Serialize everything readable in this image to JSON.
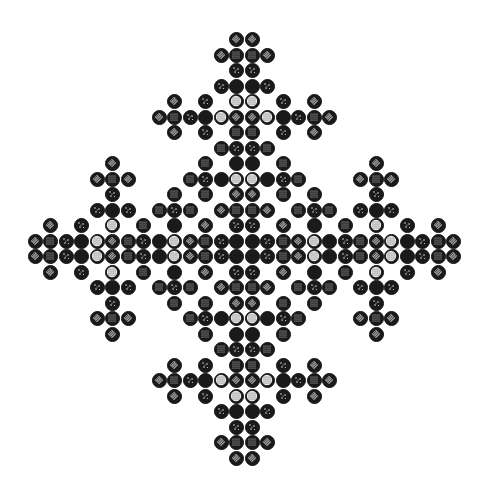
{
  "figure": {
    "title": "",
    "symmetry": "four-fold mirror (horizontal and vertical)",
    "grid_size": 28,
    "pitch_px": 15.5,
    "origin_px": [
      35,
      39.5
    ],
    "cell_types": {
      "D": "diamond-hatched",
      "G": "dense-dot-grid",
      "S": "sparse-dots",
      "B": "solid-black",
      "L": "light-dotted"
    },
    "colors": {
      "ink": "#111111",
      "fill": "#1a1a1a",
      "light": "#e8e8e8",
      "hatch": "#9a9a9a",
      "paper": "#ffffff"
    },
    "quadrant_top_left": [
      ".............D",
      "............DG",
      ".............S",
      "............SB",
      ".........D.S.L",
      "........DGSBLD",
      ".........D.S.G",
      "............GS",
      ".....D.....G.B",
      "....DGD...GSBL",
      ".....S...G.G.D",
      "....SBS.GSG.DG",
      ".D.S.L.G.B.D.S",
      "DGSBLDGSBLDGSB"
    ]
  }
}
